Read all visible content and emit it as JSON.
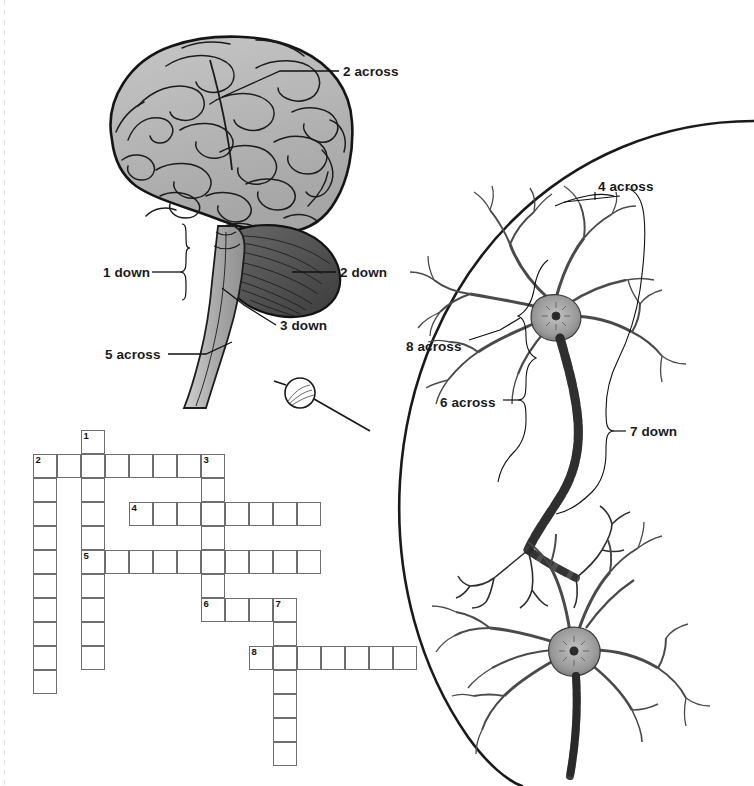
{
  "page": {
    "background_color": "#ffffff",
    "width": 754,
    "height": 786
  },
  "figure_brain": {
    "name": "brain-lateral-view-illustration",
    "description": "Lateral view line drawing of a human brain with cerebrum, cerebellum and brainstem/spinal cord",
    "fill_color": "#b3b3b3",
    "cerebellum_color": "#555555",
    "outline_color": "#1a1a1a"
  },
  "figure_neurons": {
    "name": "neuron-pair-illustration",
    "description": "Two multipolar neurons connected by a myelinated axon inside a magnified circular callout",
    "fill_color": "#7a7a7a",
    "outline_color": "#2b2b2b"
  },
  "magnifier": {
    "name": "magnifier-circle",
    "description": "Small circle on the spinal cord indicating the magnified area"
  },
  "callout_arc": {
    "name": "magnification-callout-arc",
    "description": "Large arc enclosing the magnified neuron view"
  },
  "labels": [
    {
      "id": "label-2-across",
      "text": "2 across",
      "x": 343,
      "y": 65,
      "leader": "line"
    },
    {
      "id": "label-1-down",
      "text": "1 down",
      "x": 103,
      "y": 266,
      "leader": "brace"
    },
    {
      "id": "label-2-down",
      "text": "2 down",
      "x": 340,
      "y": 266,
      "leader": "line"
    },
    {
      "id": "label-3-down",
      "text": "3 down",
      "x": 280,
      "y": 319,
      "leader": "line"
    },
    {
      "id": "label-5-across",
      "text": "5 across",
      "x": 105,
      "y": 348,
      "leader": "line"
    },
    {
      "id": "label-4-across",
      "text": "4 across",
      "x": 598,
      "y": 180,
      "leader": "line"
    },
    {
      "id": "label-8-across",
      "text": "8 across",
      "x": 406,
      "y": 340,
      "leader": "line"
    },
    {
      "id": "label-6-across",
      "text": "6 across",
      "x": 440,
      "y": 396,
      "leader": "brace"
    },
    {
      "id": "label-7-down",
      "text": "7 down",
      "x": 630,
      "y": 425,
      "leader": "brace"
    }
  ],
  "crossword": {
    "name": "crossword-grid",
    "cell_size": 24,
    "origin_x": 33,
    "origin_y": 430,
    "entries": [
      {
        "number": "1",
        "direction": "down",
        "clue_ref": "1 down",
        "col": 2,
        "row": 0,
        "length": 10
      },
      {
        "number": "2",
        "direction": "across",
        "clue_ref": "2 across",
        "col": 0,
        "row": 1,
        "length": 8
      },
      {
        "number": "2",
        "direction": "down",
        "clue_ref": "2 down",
        "col": 0,
        "row": 1,
        "length": 10
      },
      {
        "number": "3",
        "direction": "down",
        "clue_ref": "3 down",
        "col": 7,
        "row": 1,
        "length": 7
      },
      {
        "number": "4",
        "direction": "across",
        "clue_ref": "4 across",
        "col": 4,
        "row": 3,
        "length": 8
      },
      {
        "number": "5",
        "direction": "across",
        "clue_ref": "5 across",
        "col": 2,
        "row": 5,
        "length": 10
      },
      {
        "number": "6",
        "direction": "across",
        "clue_ref": "6 across",
        "col": 7,
        "row": 7,
        "length": 4
      },
      {
        "number": "7",
        "direction": "down",
        "clue_ref": "7 down",
        "col": 10,
        "row": 7,
        "length": 7
      },
      {
        "number": "8",
        "direction": "across",
        "clue_ref": "8 across",
        "col": 9,
        "row": 9,
        "length": 7
      }
    ],
    "numbered_cells": [
      {
        "number": "1",
        "col": 2,
        "row": 0
      },
      {
        "number": "2",
        "col": 0,
        "row": 1
      },
      {
        "number": "3",
        "col": 7,
        "row": 1
      },
      {
        "number": "4",
        "col": 4,
        "row": 3
      },
      {
        "number": "5",
        "col": 2,
        "row": 5
      },
      {
        "number": "6",
        "col": 7,
        "row": 7
      },
      {
        "number": "7",
        "col": 10,
        "row": 7
      },
      {
        "number": "8",
        "col": 9,
        "row": 9
      }
    ]
  }
}
